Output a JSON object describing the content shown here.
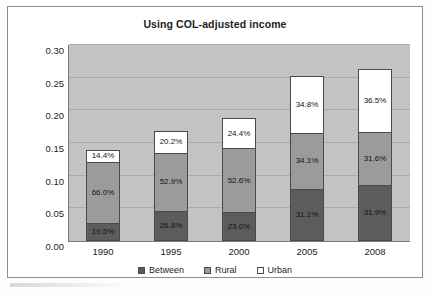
{
  "chart_data": {
    "type": "bar",
    "subtype": "stacked-bar",
    "title": "Using COL-adjusted income",
    "xlabel": "",
    "ylabel": "",
    "categories": [
      "1990",
      "1995",
      "2000",
      "2005",
      "2008"
    ],
    "ylim": [
      0.0,
      0.3
    ],
    "ytick_labels": [
      "0.00",
      "0.05",
      "0.10",
      "0.15",
      "0.20",
      "0.25",
      "0.30"
    ],
    "ytick_values": [
      0.0,
      0.05,
      0.1,
      0.15,
      0.2,
      0.25,
      0.3
    ],
    "grid": true,
    "legend_position": "bottom",
    "series": [
      {
        "name": "Between",
        "color": "#5c5c5c",
        "values": [
          0.028,
          0.046,
          0.044,
          0.08,
          0.085
        ],
        "labels": [
          "19.5%",
          "26.8%",
          "23.0%",
          "31.1%",
          "31.9%"
        ]
      },
      {
        "name": "Rural",
        "color": "#9b9b9b",
        "values": [
          0.094,
          0.091,
          0.1,
          0.087,
          0.084
        ],
        "labels": [
          "66.0%",
          "52.9%",
          "52.6%",
          "34.1%",
          "31.6%"
        ]
      },
      {
        "name": "Urban",
        "color": "#ffffff",
        "values": [
          0.021,
          0.035,
          0.047,
          0.089,
          0.097
        ],
        "labels": [
          "14.4%",
          "20.2%",
          "24.4%",
          "34.8%",
          "36.5%"
        ]
      }
    ],
    "totals": [
      0.143,
      0.172,
      0.191,
      0.256,
      0.265
    ]
  },
  "legend": {
    "items": [
      {
        "label": "Between",
        "swatch": "#5c5c5c"
      },
      {
        "label": "Rural",
        "swatch": "#9b9b9b"
      },
      {
        "label": "Urban",
        "swatch": "#ffffff"
      }
    ]
  },
  "colors": {
    "plot_background": "#c3c3c3",
    "gridline": "#a9a9a9",
    "axis": "#7a7a7a",
    "card_border": "#8d8d8d",
    "text": "#1d1d1d"
  }
}
